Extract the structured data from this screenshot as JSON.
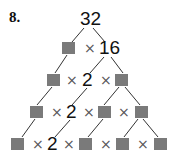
{
  "problem": {
    "label": "8."
  },
  "tree": {
    "root": "32",
    "rows": [
      {
        "items": [
          {
            "type": "box"
          },
          {
            "type": "times"
          },
          {
            "type": "num",
            "value": "16"
          }
        ]
      },
      {
        "items": [
          {
            "type": "box"
          },
          {
            "type": "times"
          },
          {
            "type": "num",
            "value": "2"
          },
          {
            "type": "times"
          },
          {
            "type": "box"
          }
        ]
      },
      {
        "items": [
          {
            "type": "box"
          },
          {
            "type": "times"
          },
          {
            "type": "num",
            "value": "2"
          },
          {
            "type": "times"
          },
          {
            "type": "box"
          },
          {
            "type": "times"
          },
          {
            "type": "box"
          }
        ]
      },
      {
        "items": [
          {
            "type": "box"
          },
          {
            "type": "times"
          },
          {
            "type": "num",
            "value": "2"
          },
          {
            "type": "times"
          },
          {
            "type": "box"
          },
          {
            "type": "times"
          },
          {
            "type": "box"
          },
          {
            "type": "times"
          },
          {
            "type": "box"
          }
        ]
      }
    ],
    "times_symbol": "×",
    "line_color": "#333333",
    "box_style": "dotted-grid-blank"
  }
}
